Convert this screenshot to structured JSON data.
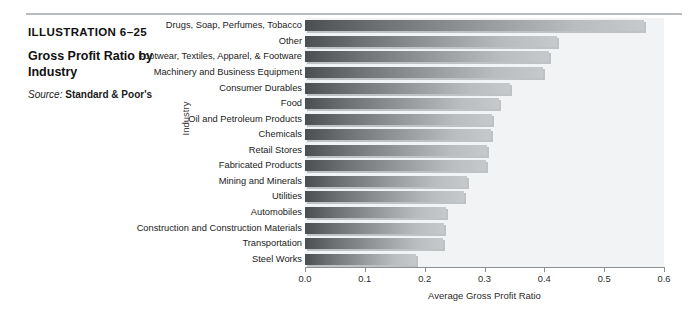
{
  "caption": {
    "illustration_number": "ILLUSTRATION 6–25",
    "title": "Gross Profit Ratio by Industry",
    "source_label": "Source:",
    "source_value": "Standard & Poor's"
  },
  "colors": {
    "bar_dark": "#4c4f52",
    "bar_light": "#c6c9cc",
    "plot_background": "#f2f3f4",
    "axis": "#8d9093",
    "rule": "#b9bcbe",
    "text": "#1a1a1a"
  },
  "chart_data": {
    "type": "bar",
    "orientation": "horizontal",
    "title": "Gross Profit Ratio by Industry",
    "xlabel": "Average Gross Profit Ratio",
    "ylabel": "Industry",
    "xlim": [
      0.0,
      0.6
    ],
    "xticks": [
      0.0,
      0.1,
      0.2,
      0.3,
      0.4,
      0.5,
      0.6
    ],
    "xtick_labels": [
      "0.0",
      "0.1",
      "0.2",
      "0.3",
      "0.4",
      "0.5",
      "0.6"
    ],
    "grid": false,
    "legend": "none",
    "categories": [
      "Drugs, Soap, Perfumes, Tobacco",
      "Other",
      "Footwear, Textiles, Apparel, & Footware",
      "Machinery and Business Equipment",
      "Consumer Durables",
      "Food",
      "Oil and Petroleum Products",
      "Chemicals",
      "Retail Stores",
      "Fabricated Products",
      "Mining and Minerals",
      "Utilities",
      "Automobiles",
      "Construction and Construction Materials",
      "Transportation",
      "Steel Works"
    ],
    "values": [
      0.566,
      0.422,
      0.407,
      0.397,
      0.342,
      0.325,
      0.313,
      0.311,
      0.305,
      0.303,
      0.27,
      0.265,
      0.236,
      0.233,
      0.231,
      0.185
    ]
  }
}
